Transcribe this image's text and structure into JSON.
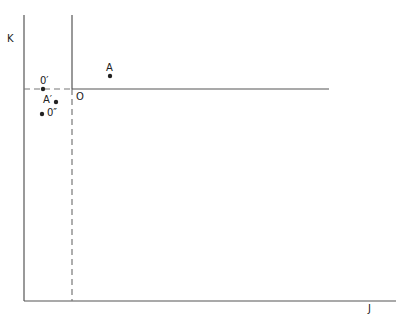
{
  "diagram": {
    "axes": {
      "x_label": "J",
      "y_label": "K"
    },
    "origin_label": "O",
    "points": [
      {
        "id": "A",
        "label": "A",
        "x": 110,
        "y": 76
      },
      {
        "id": "O-prime",
        "label": "0′",
        "x": 43,
        "y": 89
      },
      {
        "id": "A-prime",
        "label": "A′",
        "x": 56,
        "y": 102
      },
      {
        "id": "O-double-prime",
        "label": "0″",
        "x": 42,
        "y": 114
      }
    ],
    "colors": {
      "line": "#555555",
      "dashed": "#777777",
      "point": "#222222"
    }
  }
}
